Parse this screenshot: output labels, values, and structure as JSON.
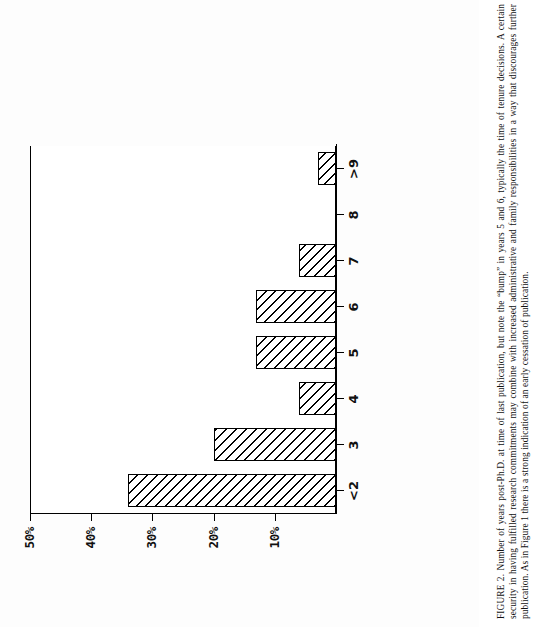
{
  "figure": {
    "label": "FIGURE 2.",
    "caption": "FIGURE 2. Number of years post-Ph.D. at time of last publication, but note the “bump” in years 5 and 6, typically the time of tenure decisions. A certain security in having fulfilled research commitments may combine with increased administrative and family responsibilities in a way that discourages further publication. As in Figure 1 there is a strong indication of an early cessation of publication."
  },
  "chart_data": {
    "type": "bar",
    "orientation": "vertical-printed-sideways",
    "title": "",
    "xlabel": "",
    "ylabel": "",
    "categories": [
      "<2",
      "3",
      "4",
      "5",
      "6",
      "7",
      "8",
      ">9"
    ],
    "values": [
      34,
      20,
      6,
      13,
      13,
      6,
      0,
      3
    ],
    "ylim": [
      0,
      50
    ],
    "yticks": [
      0,
      10,
      20,
      30,
      40,
      50
    ],
    "ytick_labels": [
      "",
      "10%",
      "20%",
      "30%",
      "40%",
      "50%"
    ],
    "grid": false,
    "legend": null,
    "bar_fill": "diagonal-hatch",
    "bar_edge_color": "#000000",
    "background_color": "#ffffff"
  },
  "axis": {
    "ticks": [
      {
        "label": "50%",
        "value": 50
      },
      {
        "label": "40%",
        "value": 40
      },
      {
        "label": "30%",
        "value": 30
      },
      {
        "label": "20%",
        "value": 20
      },
      {
        "label": "10%",
        "value": 10
      }
    ]
  }
}
